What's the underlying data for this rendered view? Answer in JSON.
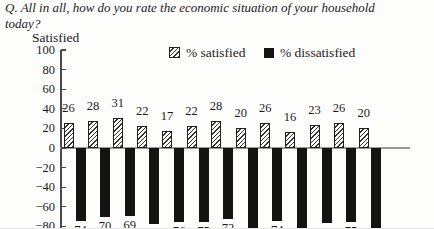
{
  "title": {
    "lines": [
      "Q. All in all, how do you rate the economic situation of your household",
      "today?"
    ]
  },
  "y_axis_label": "Satisfied",
  "legend": {
    "satisfied_label": "% satisfied",
    "dissatisfied_label": "% dissatisfied"
  },
  "chart_data": {
    "type": "bar",
    "title": "Q. All in all, how do you rate the economic situation of your household today?",
    "ylabel": "Satisfied",
    "ylim": [
      -80,
      100
    ],
    "yticks": [
      100,
      80,
      60,
      40,
      20,
      0,
      -20,
      -40,
      -60,
      -80
    ],
    "grid": false,
    "legend_position": "top",
    "x_axis_labels_visible": false,
    "series": [
      {
        "name": "% satisfied",
        "style": "hatched",
        "data_labels": "above",
        "values": [
          26,
          28,
          31,
          22,
          17,
          22,
          28,
          20,
          26,
          16,
          23,
          26,
          20
        ]
      },
      {
        "name": "% dissatisfied",
        "style": "solid-black",
        "data_labels": "below-absolute",
        "values": [
          -74,
          -70,
          -69,
          -78,
          -76,
          -75,
          -72,
          -82,
          -74,
          -82,
          -77,
          -75,
          -82
        ]
      }
    ]
  }
}
